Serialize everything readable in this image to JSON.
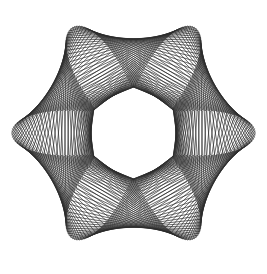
{
  "figure": {
    "symmetry_order": 6,
    "stroke_color": "#2b2b2b",
    "background_color": "#ffffff"
  }
}
